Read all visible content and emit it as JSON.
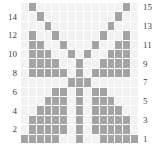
{
  "chart_data": {
    "type": "heatmap",
    "title": "",
    "xlabel": "",
    "ylabel": "",
    "grid": true,
    "legend_position": "none",
    "nrows": 15,
    "ncols": 15,
    "colors": {
      "background": "#ffffff",
      "cell_off": "#f2f2f2",
      "cell_on": "#a3a3a3",
      "gridline": "#ffffff",
      "tick_label": "#444444"
    },
    "left_axis": {
      "name": "left-tick-labels",
      "labels": [
        "",
        "14",
        "",
        "12",
        "",
        "10",
        "",
        "8",
        "",
        "6",
        "",
        "4",
        "",
        "2",
        ""
      ]
    },
    "right_axis": {
      "name": "right-tick-labels",
      "labels": [
        "15",
        "",
        "13",
        "",
        "11",
        "",
        "9",
        "",
        "7",
        "",
        "5",
        "",
        "3",
        "",
        "1"
      ]
    },
    "row_order_top_to_bottom": [
      15,
      14,
      13,
      12,
      11,
      10,
      9,
      8,
      7,
      6,
      5,
      4,
      3,
      2,
      1
    ],
    "columns": [
      1,
      2,
      3,
      4,
      5,
      6,
      7,
      8,
      9,
      10,
      11,
      12,
      13,
      14,
      15
    ],
    "values": [
      [
        0,
        1,
        0,
        0,
        0,
        0,
        0,
        0,
        0,
        0,
        0,
        0,
        0,
        1,
        0
      ],
      [
        0,
        0,
        1,
        0,
        0,
        0,
        0,
        0,
        0,
        0,
        0,
        0,
        1,
        0,
        0
      ],
      [
        0,
        0,
        0,
        1,
        0,
        0,
        0,
        0,
        0,
        0,
        0,
        1,
        0,
        0,
        0
      ],
      [
        0,
        1,
        0,
        0,
        1,
        0,
        0,
        0,
        0,
        0,
        1,
        0,
        0,
        1,
        0
      ],
      [
        0,
        1,
        1,
        0,
        0,
        1,
        0,
        0,
        0,
        1,
        0,
        0,
        1,
        1,
        0
      ],
      [
        0,
        1,
        1,
        1,
        0,
        0,
        1,
        0,
        1,
        0,
        0,
        1,
        1,
        1,
        0
      ],
      [
        0,
        1,
        1,
        1,
        1,
        0,
        0,
        1,
        0,
        0,
        1,
        1,
        1,
        1,
        0
      ],
      [
        0,
        1,
        1,
        1,
        1,
        1,
        0,
        1,
        0,
        1,
        1,
        1,
        1,
        1,
        0
      ],
      [
        0,
        0,
        0,
        0,
        0,
        0,
        1,
        1,
        1,
        0,
        0,
        0,
        0,
        0,
        0
      ],
      [
        0,
        0,
        0,
        0,
        1,
        1,
        0,
        1,
        0,
        1,
        1,
        0,
        0,
        0,
        0
      ],
      [
        0,
        0,
        0,
        1,
        1,
        1,
        0,
        1,
        0,
        1,
        1,
        1,
        0,
        0,
        0
      ],
      [
        0,
        0,
        1,
        1,
        1,
        1,
        0,
        1,
        0,
        1,
        1,
        1,
        1,
        0,
        0
      ],
      [
        0,
        1,
        1,
        1,
        1,
        1,
        0,
        1,
        0,
        1,
        1,
        1,
        1,
        1,
        0
      ],
      [
        0,
        1,
        1,
        1,
        1,
        1,
        0,
        1,
        0,
        1,
        1,
        1,
        1,
        1,
        0
      ],
      [
        1,
        1,
        1,
        1,
        1,
        0,
        0,
        1,
        0,
        0,
        1,
        1,
        1,
        1,
        1
      ]
    ]
  }
}
